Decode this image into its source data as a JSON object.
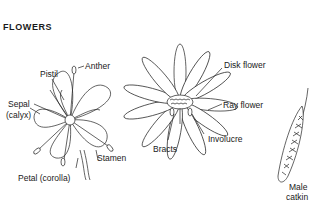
{
  "title": "FLOWERS",
  "diagrams": [
    {
      "name": "simple-flower",
      "labels": {
        "pistil": "Pistil",
        "anther": "Anther",
        "sepal_1": "Sepal",
        "sepal_2": "(calyx)",
        "stamen": "Stamen",
        "petal": "Petal (corolla)"
      }
    },
    {
      "name": "composite-flower",
      "labels": {
        "disk": "Disk flower",
        "ray": "Ray flower",
        "involucre": "Involucre",
        "bracts": "Bracts"
      }
    },
    {
      "name": "catkin",
      "labels": {
        "male_1": "Male",
        "male_2": "catkin"
      }
    }
  ],
  "colors": {
    "ink": "#1a1a1a",
    "background": "#ffffff"
  }
}
